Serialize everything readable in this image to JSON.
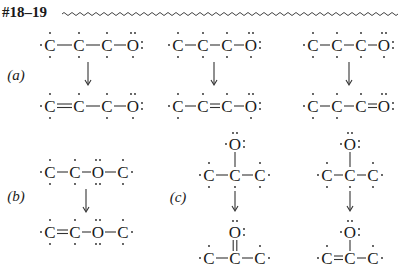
{
  "header": {
    "title": "#18–19"
  },
  "labels": {
    "a": "(a)",
    "b": "(b)",
    "c": "(c)"
  },
  "atoms": {
    "C": "C",
    "O": "O"
  },
  "structures": {
    "a1_top": "·C–C–C–O: (radical chain)",
    "a1_bottom": "·C=C–C–O:",
    "a2_top": "·C–C–C–O:",
    "a2_bottom": "·C–C=C–O:",
    "a3_top": "·C–C–C–O:",
    "a3_bottom": "·C–C–C=O:",
    "b_top": "·C–C–O–C·",
    "b_bottom": "·C=C–O–C·",
    "c1_top": "O on central C of ·C–C–C·",
    "c1_bottom": "O=C central of ·C–C–C·",
    "c2_top": "O on central C of ·C–C–C·",
    "c2_bottom": "O on central C of ·C=C–C·"
  }
}
